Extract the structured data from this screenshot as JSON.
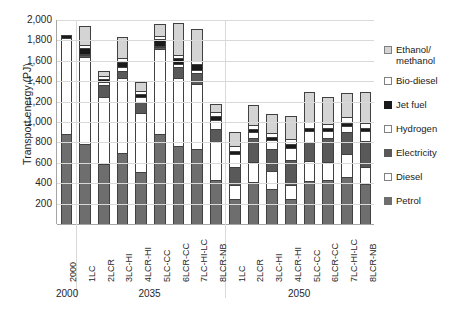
{
  "chart_data": {
    "type": "bar",
    "subtype": "stacked-column",
    "title": "",
    "xlabel": "",
    "ylabel": "Transport energy (PJ)",
    "ylim": [
      0,
      2000
    ],
    "ytick_values": [
      0,
      200,
      400,
      600,
      800,
      1000,
      1200,
      1400,
      1600,
      1800,
      2000
    ],
    "ytick_labels": [
      "",
      "200",
      "400",
      "600",
      "800",
      "1,000",
      "1,200",
      "1,400",
      "1,600",
      "1,800",
      "2,000"
    ],
    "grid": true,
    "legend_position": "right",
    "categories": [
      "2000",
      "1LC",
      "2LCR",
      "3LC-HI",
      "4LCR-HI",
      "5LC-CC",
      "6LCR-CC",
      "7LC-HI-LC",
      "8LCR-NB",
      "1LC",
      "2LCR",
      "3LC-HI",
      "4LCR-HI",
      "5LC-CC",
      "6LCR-CC",
      "7LC-HI-LC",
      "8LCR-NB"
    ],
    "group_labels": [
      "2000",
      "2035",
      "2050"
    ],
    "group_spans": [
      1,
      8,
      8
    ],
    "series": [
      {
        "name": "Petrol",
        "color": "#6e6e6e",
        "values": [
          880,
          780,
          590,
          700,
          510,
          880,
          760,
          740,
          430,
          250,
          410,
          340,
          250,
          420,
          430,
          460,
          390
        ]
      },
      {
        "name": "Diesel",
        "color": "#ffffff",
        "values": [
          940,
          860,
          660,
          730,
          580,
          840,
          670,
          630,
          370,
          130,
          200,
          180,
          130,
          200,
          180,
          230,
          170
        ]
      },
      {
        "name": "Electricity",
        "color": "#595959",
        "values": [
          0,
          20,
          110,
          75,
          110,
          20,
          110,
          110,
          130,
          180,
          230,
          215,
          250,
          180,
          230,
          210,
          250
        ]
      },
      {
        "name": "Hydrogen",
        "color": "#ffffff",
        "values": [
          0,
          10,
          30,
          30,
          45,
          10,
          30,
          30,
          90,
          130,
          60,
          90,
          120,
          110,
          70,
          60,
          100
        ]
      },
      {
        "name": "Jet fuel",
        "color": "#1a1a1a",
        "values": [
          30,
          60,
          35,
          55,
          30,
          60,
          60,
          55,
          35,
          30,
          35,
          30,
          30,
          35,
          30,
          35,
          30
        ]
      },
      {
        "name": "Bio-diesel",
        "color": "#ffffff",
        "values": [
          0,
          30,
          25,
          35,
          30,
          30,
          25,
          30,
          40,
          45,
          35,
          40,
          55,
          60,
          45,
          50,
          55
        ]
      },
      {
        "name": "Ethanol/ methanol",
        "color": "#d4d4d4",
        "values": [
          0,
          180,
          50,
          210,
          90,
          120,
          320,
          320,
          80,
          140,
          195,
          180,
          220,
          290,
          260,
          240,
          300
        ]
      }
    ]
  },
  "legend": {
    "items": [
      {
        "label": "Ethanol/",
        "label2": "methanol",
        "swatch": "#d4d4d4",
        "border": "#808080"
      },
      {
        "label": "Bio-diesel",
        "label2": "",
        "swatch": "#ffffff",
        "border": "#808080"
      },
      {
        "label": "Jet fuel",
        "label2": "",
        "swatch": "#1a1a1a",
        "border": "#1a1a1a"
      },
      {
        "label": "Hydrogen",
        "label2": "",
        "swatch": "#ffffff",
        "border": "#808080"
      },
      {
        "label": "Electricity",
        "label2": "",
        "swatch": "#595959",
        "border": "#595959"
      },
      {
        "label": "Diesel",
        "label2": "",
        "swatch": "#ffffff",
        "border": "#808080"
      },
      {
        "label": "Petrol",
        "label2": "",
        "swatch": "#6e6e6e",
        "border": "#6e6e6e"
      }
    ]
  },
  "colors": {
    "grid": "#d9d9d9",
    "axis": "#a6a6a6",
    "bar_outline": "#404040",
    "text": "#262626",
    "background": "#ffffff"
  }
}
